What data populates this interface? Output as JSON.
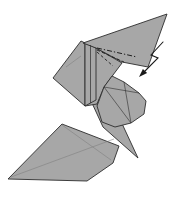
{
  "figure": {
    "canvas": {
      "width": 175,
      "height": 197,
      "background": "#ffffff"
    },
    "palette": {
      "paper": "#a7a7a7",
      "outline": "#2d2d2d",
      "crease": "#7d7d7d",
      "fold_line": "#1f1f1f",
      "arrow": "#1a1a1a"
    },
    "shapes": [
      {
        "name": "base-diamond-flap",
        "points": "8,179 62,124 119,146 113,163 87,181",
        "fill": "paper",
        "stroke": "outline",
        "stroke_width": 0.9
      },
      {
        "name": "neck-spike-flap",
        "points": "86,90 118,115 138,158 103,127",
        "fill": "paper",
        "stroke": "outline",
        "stroke_width": 0.9
      },
      {
        "name": "neck-upper-flap",
        "points": "85,43 96,48 122,63 104,87 97,104 85,106",
        "fill": "paper",
        "stroke": "outline",
        "stroke_width": 0.9
      },
      {
        "name": "head-flap",
        "points": "104,87 112,76 124,82 139,93 146,101 144,114 131,123 115,127 102,122 97,106",
        "fill": "paper",
        "stroke": "outline",
        "stroke_width": 0.9
      },
      {
        "name": "left-wing-flap",
        "points": "81,41 53,78 85,106 85,43",
        "fill": "paper",
        "stroke": "outline",
        "stroke_width": 0.9
      },
      {
        "name": "pleat-strip",
        "points": "85,43 96,48 96,100 85,106",
        "fill": "paper",
        "stroke": "outline",
        "stroke_width": 0.9
      },
      {
        "name": "long-point-flap",
        "points": "167,14 83,43 96,48 122,62 148,67",
        "fill": "paper",
        "stroke": "outline",
        "stroke_width": 0.9
      }
    ],
    "lines": [
      {
        "name": "diamond-crease-1",
        "x1": 11,
        "y1": 177,
        "x2": 114,
        "y2": 139,
        "stroke": "crease",
        "width": 0.55,
        "dash": ""
      },
      {
        "name": "diamond-crease-2",
        "x1": 62,
        "y1": 125,
        "x2": 111,
        "y2": 160,
        "stroke": "crease",
        "width": 0.55,
        "dash": ""
      },
      {
        "name": "head-facet-1",
        "x1": 104,
        "y1": 87,
        "x2": 131,
        "y2": 123,
        "stroke": "outline",
        "width": 0.6,
        "dash": ""
      },
      {
        "name": "head-facet-2",
        "x1": 104,
        "y1": 87,
        "x2": 139,
        "y2": 93,
        "stroke": "outline",
        "width": 0.6,
        "dash": ""
      },
      {
        "name": "head-facet-3",
        "x1": 124,
        "y1": 82,
        "x2": 131,
        "y2": 123,
        "stroke": "outline",
        "width": 0.6,
        "dash": ""
      },
      {
        "name": "wing-crease",
        "x1": 66,
        "y1": 67,
        "x2": 81,
        "y2": 56,
        "stroke": "crease",
        "width": 0.55,
        "dash": ""
      },
      {
        "name": "pleat-layer-line",
        "x1": 90.5,
        "y1": 45,
        "x2": 90.5,
        "y2": 103,
        "stroke": "outline",
        "width": 0.7,
        "dash": ""
      },
      {
        "name": "crimp-fold-line-1",
        "x1": 97,
        "y1": 48,
        "x2": 137,
        "y2": 57,
        "stroke": "fold_line",
        "width": 1.0,
        "dash": "5 2 1.3 2"
      },
      {
        "name": "crimp-fold-line-2",
        "x1": 97,
        "y1": 50,
        "x2": 124,
        "y2": 62,
        "stroke": "fold_line",
        "width": 0.9,
        "dash": "3.2 2.2"
      },
      {
        "name": "crimp-fold-line-3",
        "x1": 97,
        "y1": 52,
        "x2": 113,
        "y2": 66,
        "stroke": "fold_line",
        "width": 0.9,
        "dash": "3 2.2"
      }
    ],
    "arrow": {
      "name": "crimp-arrow-icon",
      "shaft_points": "163,42 151,55 158,58 145,71",
      "head_points": "139,77 147.1,73.1 142.9,68.9",
      "stroke": "arrow",
      "width": 1.1
    }
  }
}
